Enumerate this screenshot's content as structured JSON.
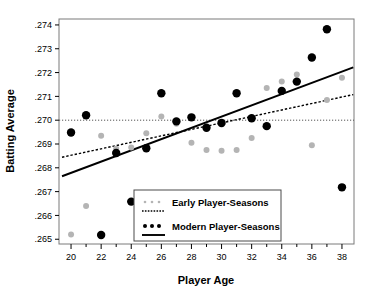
{
  "chart_data": {
    "type": "scatter",
    "title": "",
    "xlabel": "Player Age",
    "ylabel": "Batting Average",
    "xlim": [
      19.2,
      38.8
    ],
    "ylim": [
      0.2648,
      0.27425
    ],
    "grid": false,
    "legend_position": "bottom-center",
    "x_ticks": [
      20,
      22,
      24,
      26,
      28,
      30,
      32,
      34,
      36,
      38
    ],
    "x_tick_labels": [
      "20",
      "22",
      "24",
      "26",
      "28",
      "30",
      "32",
      "34",
      "36",
      "38"
    ],
    "x_minor_ticks": [
      21,
      23,
      25,
      27,
      29,
      31,
      33,
      35,
      37
    ],
    "y_ticks": [
      0.265,
      0.266,
      0.267,
      0.268,
      0.269,
      0.27,
      0.271,
      0.272,
      0.273,
      0.274
    ],
    "y_tick_labels": [
      ".265",
      ".266",
      ".267",
      ".268",
      ".269",
      ".270",
      ".271",
      ".272",
      ".273",
      ".274"
    ],
    "reference_line": {
      "name": "league-average-line",
      "y": 0.27,
      "style": "dotted",
      "color": "#555555"
    },
    "series": [
      {
        "name": "Early Player-Seasons",
        "marker": "dot",
        "color": "#b4b4b4",
        "point_size": 3.0,
        "x": [
          20,
          21,
          22,
          23,
          24,
          25,
          26,
          27,
          28,
          29,
          30,
          31,
          32,
          33,
          34,
          35,
          36,
          37,
          38
        ],
        "y": [
          0.2652,
          0.2664,
          0.26935,
          0.2688,
          0.26885,
          0.26945,
          0.27015,
          0.26985,
          0.26905,
          0.26875,
          0.26872,
          0.26875,
          0.26925,
          0.27135,
          0.27162,
          0.27192,
          0.26895,
          0.27085,
          0.27178
        ],
        "trend": {
          "name": "early-trend-line",
          "style": "dashed",
          "color": "#000000",
          "x_start": 19.4,
          "y_start": 0.268445,
          "x_end": 38.75,
          "y_end": 0.271075
        }
      },
      {
        "name": "Modern Player-Seasons",
        "marker": "dot",
        "color": "#000000",
        "point_size": 4.2,
        "x": [
          20,
          21,
          22,
          23,
          24,
          25,
          26,
          27,
          28,
          29,
          30,
          31,
          32,
          33,
          34,
          35,
          36,
          37,
          38
        ],
        "y": [
          0.26948,
          0.27021,
          0.26518,
          0.26862,
          0.26658,
          0.26882,
          0.27113,
          0.26995,
          0.27012,
          0.26968,
          0.26988,
          0.27113,
          0.27008,
          0.26975,
          0.27123,
          0.27162,
          0.27263,
          0.27382,
          0.26718
        ],
        "trend": {
          "name": "modern-trend-line",
          "style": "solid",
          "color": "#000000",
          "x_start": 19.4,
          "y_start": 0.267645,
          "x_end": 38.75,
          "y_end": 0.272215
        }
      }
    ],
    "legend": {
      "entries": [
        {
          "label": "Early Player-Seasons",
          "marker_color": "#b4b4b4",
          "line_style": "dashed"
        },
        {
          "label": "Modern Player-Seasons",
          "marker_color": "#000000",
          "line_style": "solid"
        }
      ]
    }
  }
}
